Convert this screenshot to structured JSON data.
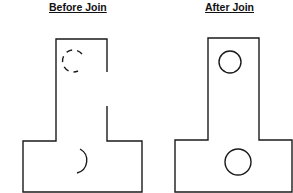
{
  "panels": [
    {
      "title": "Before Join",
      "description": "T-shaped outline with gap in right edge and broken circular arcs"
    },
    {
      "title": "After Join",
      "description": "T-shaped outline closed, two complete circles"
    }
  ],
  "colors": {
    "line": "#1a1a1a",
    "background": "#ffffff"
  }
}
